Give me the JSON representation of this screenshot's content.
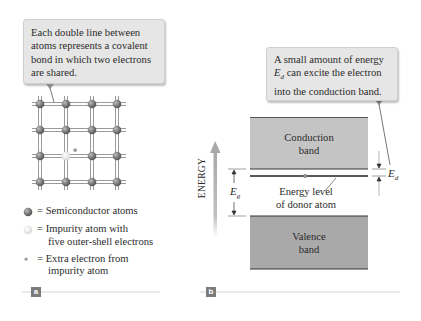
{
  "panel_a": {
    "tag": "a",
    "callout": {
      "lines": [
        "Each double line between",
        "atoms represents a covalent",
        "bond in which two electrons",
        "are shared."
      ]
    },
    "lattice": {
      "rows": 4,
      "cols": 4,
      "impurity_position": {
        "row": 3,
        "col": 2
      },
      "atom_color": "#7c7c7c",
      "impurity_color": "#e4e4e4",
      "electron_color": "#8a8a8a"
    },
    "legend": [
      {
        "symbol": "semiconductor-atom",
        "eq": "=",
        "lines": [
          "Semiconductor atoms"
        ]
      },
      {
        "symbol": "impurity-atom",
        "eq": "=",
        "lines": [
          "Impurity atom with",
          "five outer-shell electrons"
        ]
      },
      {
        "symbol": "extra-electron",
        "eq": "=",
        "lines": [
          "Extra electron from",
          "impurity atom"
        ]
      }
    ]
  },
  "panel_b": {
    "tag": "b",
    "callout": {
      "line1": "A small amount of energy",
      "line2_symbol": "E",
      "line2_sub": "d",
      "line2_rest": " can excite the electron",
      "line3": "into the conduction band."
    },
    "conduction_band": {
      "line1": "Conduction",
      "line2": "band",
      "color": "#c4c4c4"
    },
    "valence_band": {
      "line1": "Valence",
      "line2": "band",
      "color": "#a9a9a9"
    },
    "donor_level": {
      "line1": "Energy level",
      "line2": "of donor atom"
    },
    "energy_axis_label": "ENERGY",
    "gap_label": {
      "symbol": "E",
      "sub": "g"
    },
    "donor_gap_label": {
      "symbol": "E",
      "sub": "d"
    }
  },
  "colors": {
    "callout_bg": "#e6e6e6",
    "tag_bg": "#7b7b7b",
    "rule": "#d0d0d0",
    "arrow_gray": "#b5b5b5"
  }
}
